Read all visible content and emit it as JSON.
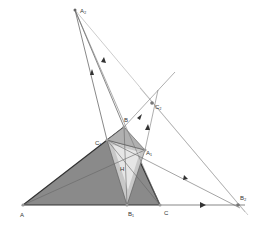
{
  "diagram": {
    "points": {
      "A2": {
        "label": "A₂",
        "x": 75,
        "y": 10
      },
      "A": {
        "label": "A",
        "x": 23,
        "y": 205
      },
      "B": {
        "label": "B",
        "x": 124,
        "y": 127
      },
      "C": {
        "label": "C",
        "x": 160,
        "y": 205
      },
      "B1": {
        "label": "B₁",
        "x": 127,
        "y": 205
      },
      "B2": {
        "label": "B₂",
        "x": 238,
        "y": 205
      },
      "C1": {
        "label": "C₁",
        "x": 107,
        "y": 140
      },
      "C2": {
        "label": "C₂",
        "x": 152,
        "y": 103
      },
      "A1": {
        "label": "A₁",
        "x": 145,
        "y": 150
      },
      "H": {
        "label": "H",
        "x": 131,
        "y": 165
      }
    },
    "colors": {
      "fill_dark": "#8a8a8a",
      "fill_light": "#c8c8c8",
      "fill_lighter": "#e6e6e6",
      "line": "#555555",
      "thin": "#9a9a9a"
    }
  }
}
